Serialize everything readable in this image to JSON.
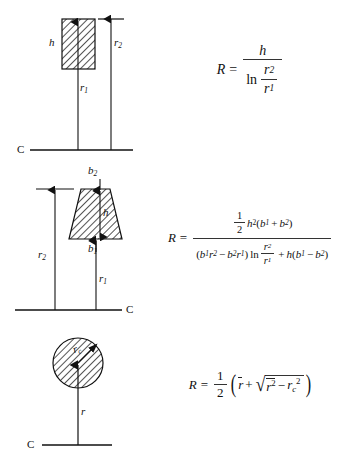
{
  "document": {
    "kind": "engineering-formula-figure",
    "background_color": "#ffffff",
    "ink_color": "#000000",
    "rows": 3
  },
  "rows": [
    {
      "id": "rectangle",
      "shape_name": "hatched-rectangle",
      "labels": {
        "height": "h",
        "inner_radius": "r",
        "inner_radius_sub": "1",
        "outer_radius": "r",
        "outer_radius_sub": "2",
        "centerline": "C"
      },
      "formula": {
        "lhs": "R",
        "equals": "=",
        "numerator": "h",
        "denominator_fn": "ln",
        "denominator_num": "r",
        "denominator_num_sub": "2",
        "denominator_den": "r",
        "denominator_den_sub": "1",
        "plain_text": "R = h / ln(r2/r1)"
      }
    },
    {
      "id": "trapezoid",
      "shape_name": "hatched-trapezoid",
      "labels": {
        "top_width": "b",
        "top_width_sub": "2",
        "bottom_width": "b",
        "bottom_width_sub": "1",
        "height": "h",
        "inner_radius": "r",
        "inner_radius_sub": "1",
        "outer_radius": "r",
        "outer_radius_sub": "2",
        "centerline": "C"
      },
      "formula": {
        "lhs": "R",
        "equals": "=",
        "plain_text": "R = (1/2 h^2 (b1 + b2)) / ((b1 r2 - b2 r1) ln(r2/r1) + h(b1 - b2))",
        "numerator": {
          "half_num": "1",
          "half_den": "2",
          "h": "h",
          "h_exp": "2",
          "open": "(",
          "b1": "b",
          "b1_sub": "1",
          "plus": "+",
          "b2": "b",
          "b2_sub": "2",
          "close": ")"
        },
        "denominator": {
          "open": "(",
          "b1": "b",
          "b1_sub": "1",
          "r2": "r",
          "r2_sub": "2",
          "minus": "−",
          "b2": "b",
          "b2_sub": "2",
          "r1": "r",
          "r1_sub": "1",
          "close": ")",
          "ln": "ln",
          "frac_num": "r",
          "frac_num_sub": "2",
          "frac_den": "r",
          "frac_den_sub": "1",
          "plus": "+",
          "h": "h",
          "open2": "(",
          "b1b": "b",
          "b1b_sub": "1",
          "minus2": "−",
          "b2b": "b",
          "b2b_sub": "2",
          "close2": ")"
        }
      }
    },
    {
      "id": "circle",
      "shape_name": "hatched-circle",
      "labels": {
        "circle_radius": "r",
        "circle_radius_sub": "c",
        "centroid_radius": "r",
        "centerline": "C"
      },
      "formula": {
        "lhs": "R",
        "equals": "=",
        "half_num": "1",
        "half_den": "2",
        "open": "(",
        "rbar": "r",
        "plus": "+",
        "radical": "√",
        "rbar_sq": "r",
        "rbar_sq_exp": "2",
        "minus": "−",
        "rc": "r",
        "rc_sub": "c",
        "rc_exp": "2",
        "close": ")",
        "plain_text": "R = 1/2 ( rbar + sqrt( rbar^2 - rc^2 ) )"
      }
    }
  ]
}
